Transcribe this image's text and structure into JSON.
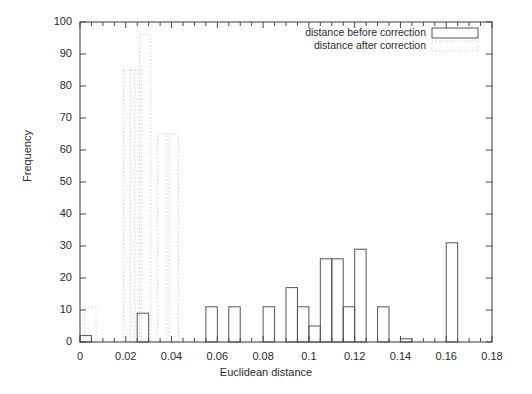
{
  "chart_data": {
    "type": "bar",
    "title": "",
    "xlabel": "Euclidean distance",
    "ylabel": "Frequency",
    "xlim": [
      0,
      0.18
    ],
    "ylim": [
      0,
      100
    ],
    "xticks": [
      "0",
      "0.02",
      "0.04",
      "0.06",
      "0.08",
      "0.1",
      "0.12",
      "0.14",
      "0.16",
      "0.18"
    ],
    "xtick_values": [
      0,
      0.02,
      0.04,
      0.06,
      0.08,
      0.1,
      0.12,
      0.14,
      0.16,
      0.18
    ],
    "yticks": [
      "0",
      "10",
      "20",
      "30",
      "40",
      "50",
      "60",
      "70",
      "80",
      "90",
      "100"
    ],
    "ytick_values": [
      0,
      10,
      20,
      30,
      40,
      50,
      60,
      70,
      80,
      90,
      100
    ],
    "grid": false,
    "legend_position": "top-right",
    "bin_width": 0.005,
    "series": [
      {
        "name": "distance before correction",
        "style": "solid-outline",
        "color": "#555555",
        "bins": [
          {
            "x0": 0.0,
            "x1": 0.005,
            "value": 2
          },
          {
            "x0": 0.025,
            "x1": 0.03,
            "value": 9
          },
          {
            "x0": 0.055,
            "x1": 0.06,
            "value": 11
          },
          {
            "x0": 0.065,
            "x1": 0.07,
            "value": 11
          },
          {
            "x0": 0.08,
            "x1": 0.085,
            "value": 11
          },
          {
            "x0": 0.09,
            "x1": 0.095,
            "value": 17
          },
          {
            "x0": 0.095,
            "x1": 0.1,
            "value": 11
          },
          {
            "x0": 0.1,
            "x1": 0.105,
            "value": 5
          },
          {
            "x0": 0.105,
            "x1": 0.11,
            "value": 26
          },
          {
            "x0": 0.11,
            "x1": 0.115,
            "value": 26
          },
          {
            "x0": 0.115,
            "x1": 0.12,
            "value": 11
          },
          {
            "x0": 0.12,
            "x1": 0.125,
            "value": 29
          },
          {
            "x0": 0.13,
            "x1": 0.135,
            "value": 11
          },
          {
            "x0": 0.14,
            "x1": 0.145,
            "value": 1
          },
          {
            "x0": 0.16,
            "x1": 0.165,
            "value": 31
          }
        ]
      },
      {
        "name": "distance after correction",
        "style": "dotted-outline",
        "color": "#cfcfcf",
        "bins": [
          {
            "x0": 0.002,
            "x1": 0.007,
            "value": 11
          },
          {
            "x0": 0.019,
            "x1": 0.024,
            "value": 85
          },
          {
            "x0": 0.022,
            "x1": 0.027,
            "value": 85
          },
          {
            "x0": 0.026,
            "x1": 0.031,
            "value": 96
          },
          {
            "x0": 0.034,
            "x1": 0.039,
            "value": 65
          },
          {
            "x0": 0.038,
            "x1": 0.043,
            "value": 65
          }
        ]
      }
    ]
  },
  "legend": {
    "entries": [
      {
        "label": "distance before correction",
        "swatch": "solid"
      },
      {
        "label": "distance after correction",
        "swatch": "dotted"
      }
    ]
  },
  "colors": {
    "axis": "#4a4a4a",
    "before": "#555555",
    "after": "#d2d2d2",
    "text": "#2b2b2b",
    "background": "#ffffff"
  }
}
